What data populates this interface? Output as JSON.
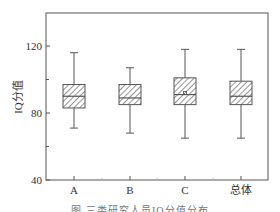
{
  "chart_data": {
    "type": "boxplot",
    "title": "",
    "xlabel": "",
    "ylabel": "IQ分值",
    "ylim": [
      40,
      140
    ],
    "yticks": [
      40,
      80,
      120
    ],
    "yticks_minor": [
      60,
      100
    ],
    "categories": [
      "A",
      "B",
      "C",
      "总体"
    ],
    "boxes": [
      {
        "name": "A",
        "whisker_low": 71,
        "q1": 83,
        "median": 90,
        "q3": 97,
        "whisker_high": 116
      },
      {
        "name": "B",
        "whisker_low": 68,
        "q1": 85,
        "median": 89,
        "q3": 97,
        "whisker_high": 107
      },
      {
        "name": "C",
        "whisker_low": 65,
        "q1": 85,
        "median": 91,
        "q3": 101,
        "whisker_high": 118,
        "mean": 92
      },
      {
        "name": "总体",
        "whisker_low": 65,
        "q1": 85,
        "median": 90,
        "q3": 99,
        "whisker_high": 118
      }
    ],
    "grid": false,
    "legend": null,
    "box_fill": "diagonal-hatch",
    "colors": {
      "axis": "#555555",
      "box": "#555555",
      "hatch": "#777777"
    }
  },
  "caption": "图 三类研究人员IQ分值分布"
}
